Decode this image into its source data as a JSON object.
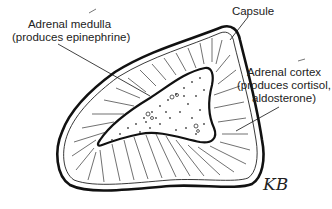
{
  "diagram": {
    "labels": {
      "medulla": {
        "line1": "Adrenal medulla",
        "line2": "(produces epinephrine)"
      },
      "capsule": {
        "line1": "Capsule"
      },
      "cortex": {
        "line1": "Adrenal cortex",
        "line2": "(produces cortisol,",
        "line3": "aldosterone)"
      }
    },
    "signature": "KB",
    "colors": {
      "ink": "#111111",
      "background": "#ffffff",
      "label_text": "#222222"
    }
  }
}
